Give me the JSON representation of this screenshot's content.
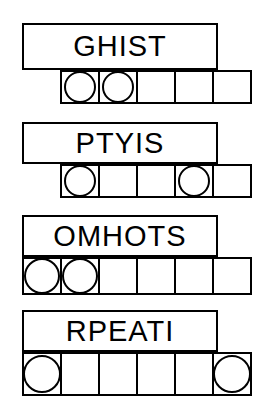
{
  "sheet": {
    "title": "word-scramble-worksheet",
    "ink_color": "#000000",
    "paper_color": "#ffffff"
  },
  "puzzles": [
    {
      "id": "puzzle-1",
      "scrambled_word": "GHIST",
      "letter_count": 5,
      "grid_cells": 5,
      "circled_cells": [
        1,
        2
      ],
      "word_box": {
        "x": 22,
        "y": 23,
        "width": 196,
        "height": 47
      },
      "grid": {
        "x": 60,
        "y": 70,
        "width": 198,
        "height": 34,
        "cell_width": 40,
        "cell_height": 34
      }
    },
    {
      "id": "puzzle-2",
      "scrambled_word": "PTYIS",
      "letter_count": 5,
      "grid_cells": 5,
      "circled_cells": [
        1,
        4
      ],
      "word_box": {
        "x": 22,
        "y": 122,
        "width": 196,
        "height": 42
      },
      "grid": {
        "x": 60,
        "y": 164,
        "width": 198,
        "height": 34,
        "cell_width": 40,
        "cell_height": 34
      }
    },
    {
      "id": "puzzle-3",
      "scrambled_word": "OMHOTS",
      "letter_count": 6,
      "grid_cells": 6,
      "circled_cells": [
        1,
        2
      ],
      "word_box": {
        "x": 22,
        "y": 215,
        "width": 196,
        "height": 42
      },
      "grid": {
        "x": 22,
        "y": 257,
        "width": 236,
        "height": 38,
        "cell_width": 40,
        "cell_height": 38
      }
    },
    {
      "id": "puzzle-4",
      "scrambled_word": "RPEATI",
      "letter_count": 6,
      "grid_cells": 6,
      "circled_cells": [
        1,
        6
      ],
      "word_box": {
        "x": 22,
        "y": 310,
        "width": 196,
        "height": 42
      },
      "grid": {
        "x": 22,
        "y": 352,
        "width": 236,
        "height": 44,
        "cell_width": 40,
        "cell_height": 44
      }
    }
  ]
}
